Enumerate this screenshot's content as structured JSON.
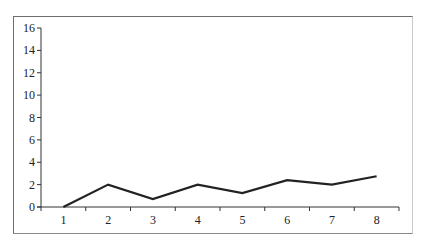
{
  "chart_data": {
    "type": "line",
    "title": "",
    "xlabel": "",
    "ylabel": "",
    "categories": [
      "1",
      "2",
      "3",
      "4",
      "5",
      "6",
      "7",
      "8"
    ],
    "series": [
      {
        "name": "Series 1",
        "values": [
          0,
          2.0,
          0.7,
          2.0,
          1.25,
          2.4,
          2.0,
          2.75
        ],
        "color": "#222222"
      }
    ],
    "ylim": [
      0,
      16
    ],
    "yticks": [
      "0",
      "2",
      "4",
      "6",
      "8",
      "10",
      "12",
      "14",
      "16"
    ],
    "grid": false,
    "legend": "none"
  }
}
